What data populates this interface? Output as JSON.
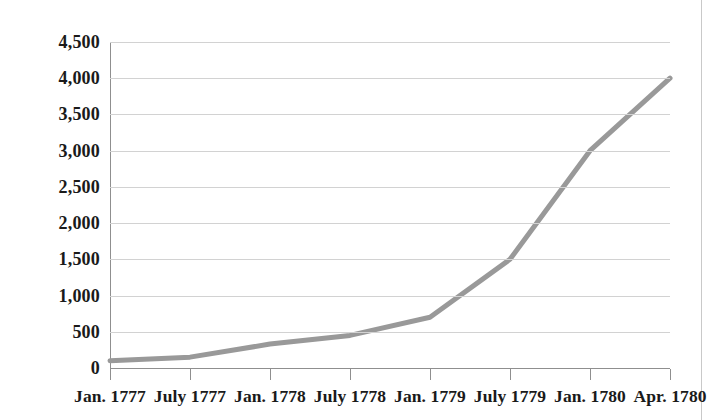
{
  "chart_data": {
    "type": "line",
    "title": "",
    "subtitle": "",
    "xlabel": "",
    "ylabel": "",
    "categories": [
      "Jan. 1777",
      "July 1777",
      "Jan. 1778",
      "July 1778",
      "Jan. 1779",
      "July 1779",
      "Jan. 1780",
      "Apr. 1780"
    ],
    "values": [
      100,
      150,
      330,
      450,
      700,
      1500,
      3000,
      4000
    ],
    "series": [
      {
        "name": "",
        "values": [
          100,
          150,
          330,
          450,
          700,
          1500,
          3000,
          4000
        ]
      }
    ],
    "ylim": [
      0,
      4500
    ],
    "ytick_values": [
      0,
      500,
      1000,
      1500,
      2000,
      2500,
      3000,
      3500,
      4000,
      4500
    ],
    "ytick_labels": [
      "0",
      "500",
      "1,000",
      "1,500",
      "2,000",
      "2,500",
      "3,000",
      "3,500",
      "4,000",
      "4,500"
    ],
    "xtick_labels": [
      "Jan. 1777",
      "July 1777",
      "Jan. 1778",
      "July 1778",
      "Jan. 1779",
      "July 1779",
      "Jan. 1780",
      "Apr. 1780"
    ],
    "grid": true,
    "grid_orientation": "horizontal",
    "legend": false,
    "legend_position": "none",
    "line_color": "#999999",
    "line_width": 5,
    "grid_color": "#d2d2d2",
    "axis_color": "#8f8f8f",
    "text_color": "#1a1a1a",
    "background_color": "#ffffff",
    "annotations": []
  }
}
